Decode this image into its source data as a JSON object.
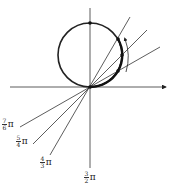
{
  "diagram": {
    "colors": {
      "stroke": "#222222",
      "background": "#ffffff"
    },
    "origin": [
      90,
      87
    ],
    "circle": {
      "cx": 90,
      "cy": 55,
      "r": 32
    },
    "labels": [
      {
        "id": "7-6-pi",
        "num": "7",
        "den": "6",
        "sym": "π"
      },
      {
        "id": "5-4-pi",
        "num": "5",
        "den": "4",
        "sym": "π"
      },
      {
        "id": "4-3-pi",
        "num": "4",
        "den": "3",
        "sym": "π"
      },
      {
        "id": "3-2-pi",
        "num": "3",
        "den": "2",
        "sym": "π"
      }
    ]
  }
}
